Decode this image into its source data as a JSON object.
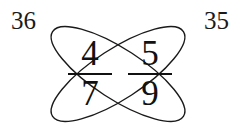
{
  "figure": {
    "kind": "butterfly-method-fraction-diagram",
    "stroke_color": "#1a1a1a",
    "text_color": "#111111",
    "background_color": "#ffffff"
  },
  "corner_labels": {
    "left": "36",
    "right": "35"
  },
  "fractions": [
    {
      "position": "left",
      "numerator": "4",
      "denominator": "7"
    },
    {
      "position": "right",
      "numerator": "5",
      "denominator": "9"
    }
  ],
  "wings": [
    {
      "name": "wing-down-right",
      "cx": 118,
      "cy": 74,
      "rx": 78,
      "ry": 25,
      "rotation_deg": 33
    },
    {
      "name": "wing-up-right",
      "cx": 118,
      "cy": 74,
      "rx": 78,
      "ry": 25,
      "rotation_deg": -33
    }
  ]
}
